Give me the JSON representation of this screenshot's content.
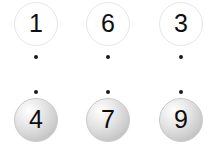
{
  "canvas": {
    "width": 217,
    "height": 146,
    "background": "#ffffff"
  },
  "diagram": {
    "type": "node-column-diagram",
    "columns": 3,
    "rows": [
      {
        "name": "top-row",
        "style": "hollow-circle",
        "fill": "#ffffff",
        "stroke": "#e6e6e6",
        "text_color": "#101010",
        "labels": [
          "1",
          "6",
          "3"
        ]
      },
      {
        "name": "bottom-row",
        "style": "shaded-sphere",
        "fill": "#d8d8d8",
        "stroke": "#c9c9c9",
        "text_color": "#0d0d0d",
        "labels": [
          "4",
          "7",
          "9"
        ]
      }
    ],
    "dot_rows": [
      {
        "name": "upper-dot-row",
        "color": "#1a1a1a",
        "count": 3
      },
      {
        "name": "lower-dot-row",
        "color": "#1a1a1a",
        "count": 3
      }
    ],
    "columns_data": [
      {
        "top_label": "1",
        "bottom_label": "4"
      },
      {
        "top_label": "6",
        "bottom_label": "7"
      },
      {
        "top_label": "3",
        "bottom_label": "9"
      }
    ]
  }
}
